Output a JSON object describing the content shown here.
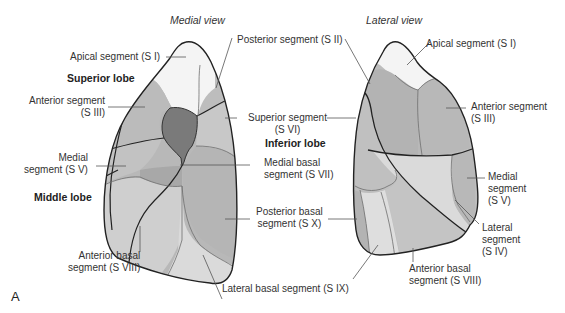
{
  "figure": {
    "panel_letter": "A",
    "colors": {
      "apical": "#f4f4f4",
      "segment_mid": "#b8b8b8",
      "segment_light": "#c9c9c9",
      "segment_lighter": "#d6d6d6",
      "segment_lightest": "#e2e2e2",
      "hilum": "#7a7a7a",
      "outline": "#222222",
      "leader": "#555555"
    }
  },
  "medial_view": {
    "title": "Medial view",
    "lobes": {
      "superior": "Superior lobe",
      "middle": "Middle lobe",
      "inferior": "Inferior lobe"
    },
    "labels": {
      "apical": "Apical segment (S I)",
      "posterior": "Posterior segment (S II)",
      "anterior_line1": "Anterior segment",
      "anterior_line2": "(S III)",
      "superior_line1": "Superior segment",
      "superior_line2": "(S VI)",
      "medial_line1": "Medial",
      "medial_line2": "segment (S V)",
      "medial_basal_line1": "Medial basal",
      "medial_basal_line2": "segment (S VII)",
      "posterior_basal_line1": "Posterior basal",
      "posterior_basal_line2": "segment (S X)",
      "anterior_basal_line1": "Anterior basal",
      "anterior_basal_line2": "segment (S VIII)",
      "lateral_basal": "Lateral basal segment (S IX)"
    }
  },
  "lateral_view": {
    "title": "Lateral view",
    "labels": {
      "apical": "Apical segment (S I)",
      "anterior_line1": "Anterior segment",
      "anterior_line2": "(S III)",
      "medial_line1": "Medial",
      "medial_line2": "segment",
      "medial_line3": "(S V)",
      "lateral_line1": "Lateral",
      "lateral_line2": "segment",
      "lateral_line3": "(S IV)",
      "anterior_basal_line1": "Anterior basal",
      "anterior_basal_line2": "segment (S VIII)"
    }
  }
}
